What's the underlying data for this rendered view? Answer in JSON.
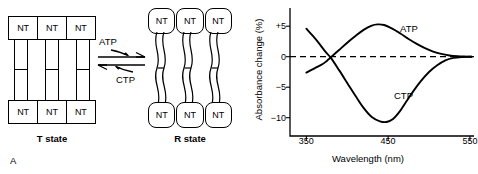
{
  "figure": {
    "panels": [
      {
        "letter": "A",
        "type": "diagram"
      },
      {
        "letter": "B",
        "type": "chart"
      }
    ]
  },
  "panel_a": {
    "letter": "A",
    "t_state": {
      "label": "T state",
      "subunit_label": "NT",
      "top_subunits": [
        "NT",
        "NT",
        "NT"
      ],
      "bottom_subunits": [
        "NT",
        "NT",
        "NT"
      ]
    },
    "r_state": {
      "label": "R state",
      "subunit_label": "NT",
      "top_subunits": [
        "NT",
        "NT",
        "NT"
      ],
      "bottom_subunits": [
        "NT",
        "NT",
        "NT"
      ]
    },
    "reaction": {
      "forward_effector": "ATP",
      "reverse_effector": "CTP",
      "arrow_type": "equilibrium"
    }
  },
  "panel_b": {
    "letter": "B",
    "chart_data": {
      "type": "line",
      "title": "",
      "xlabel": "Wavelength (nm)",
      "ylabel": "Absorbance change (%)",
      "xlim": [
        330,
        555
      ],
      "ylim": [
        -13,
        7
      ],
      "xticks": [
        350,
        450,
        550
      ],
      "xtick_labels": [
        "350",
        "450",
        "550"
      ],
      "yticks": [
        5,
        0,
        -5,
        -10
      ],
      "ytick_labels": [
        "+5",
        "0",
        "−5",
        "−10"
      ],
      "grid": false,
      "legend": "inline-annotation",
      "zero_line": {
        "value": 0,
        "style": "dashed"
      },
      "series": [
        {
          "name": "ATP",
          "label_position": "upper-right",
          "x": [
            350,
            360,
            370,
            375,
            380,
            390,
            400,
            410,
            420,
            430,
            437,
            445,
            455,
            465,
            475,
            485,
            495,
            505,
            515,
            525,
            535,
            545,
            552
          ],
          "values": [
            -2.6,
            -1.9,
            -1.2,
            -0.7,
            -0.1,
            1.1,
            2.3,
            3.4,
            4.4,
            5.1,
            5.3,
            5.2,
            4.6,
            3.8,
            2.9,
            2.1,
            1.4,
            0.85,
            0.45,
            0.2,
            0.07,
            0.02,
            0.0
          ]
        },
        {
          "name": "CTP",
          "label_position": "lower-right",
          "x": [
            350,
            358,
            366,
            374,
            380,
            390,
            400,
            410,
            420,
            430,
            440,
            448,
            456,
            464,
            472,
            480,
            490,
            500,
            510,
            520,
            530,
            540,
            552
          ],
          "values": [
            4.6,
            3.4,
            2.1,
            0.7,
            -0.2,
            -2.2,
            -4.3,
            -6.4,
            -8.4,
            -9.9,
            -10.6,
            -10.7,
            -10.2,
            -9.0,
            -7.4,
            -5.8,
            -4.0,
            -2.5,
            -1.4,
            -0.6,
            -0.2,
            -0.05,
            0.0
          ]
        }
      ],
      "crossover_point": {
        "x": 380,
        "y": 0
      }
    }
  }
}
